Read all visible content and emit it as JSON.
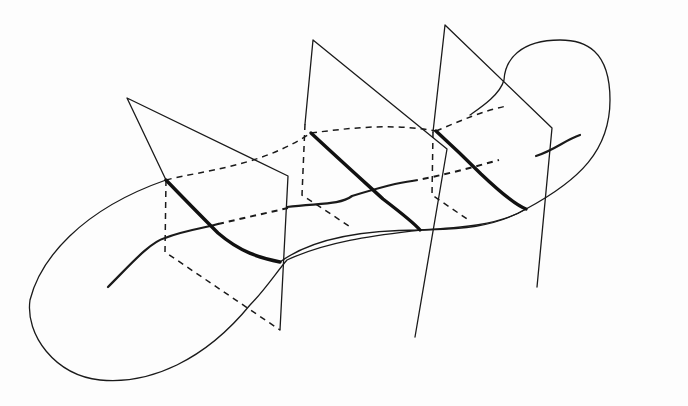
{
  "figure": {
    "colors": {
      "ink": "#1a1a1a",
      "paper": "#fdfdfd",
      "bleed": "#f0f0f0"
    },
    "background_text": [
      "",
      "",
      ""
    ],
    "planes": [
      {
        "name": "plane-1",
        "outline": "M166,180 L127,98 L288,176 L280,330",
        "hidden": "M166,180 L165,252 L280,330"
      },
      {
        "name": "plane-2",
        "outline": "M305,124 L313,40 L447,149 L415,337",
        "hidden": "M305,124 L302,195 L352,228"
      },
      {
        "name": "plane-3",
        "outline": "M433,132 L445,25 L552,128 L537,287",
        "hidden": "M433,132 L432,195 L470,221"
      }
    ],
    "slices": [
      "M166,180 C190,205 205,220 218,233 C240,252 260,258 280,262",
      "M311,133 C340,160 360,178 383,199 C400,212 415,224 420,230",
      "M436,131 C460,153 474,167 481,174 C500,192 515,205 526,209"
    ],
    "surface_outline": "M166,180 C80,210 40,260 30,300 C25,335 55,375 100,380 C150,385 205,360 250,305 C265,290 278,270 287,260 C330,240 380,235 420,230 C450,229 490,230 526,209 C580,180 610,150 610,100 C610,50 585,40 560,40 C520,40 505,60 504,80 C500,95 480,108 470,115",
    "central_curve_solid": [
      "M108,287 C130,265 150,242 165,238 C185,230 205,228 218,224",
      "M287,207 C320,203 340,205 352,196 C365,192 395,183 412,181",
      "M536,156 C555,150 565,140 580,135"
    ],
    "central_curve_hidden": [
      "M218,224 L288,208",
      "M412,181 C440,176 470,168 499,160"
    ],
    "top_edge_dashed": [
      "M166,180 C200,171 260,167 311,133",
      "M311,133 C350,128 390,123 436,131",
      "M436,131 C460,121 485,110 507,106"
    ],
    "surface_lower_edge": "M280,262 C310,240 360,230 420,230 C460,228 500,225 526,209"
  }
}
